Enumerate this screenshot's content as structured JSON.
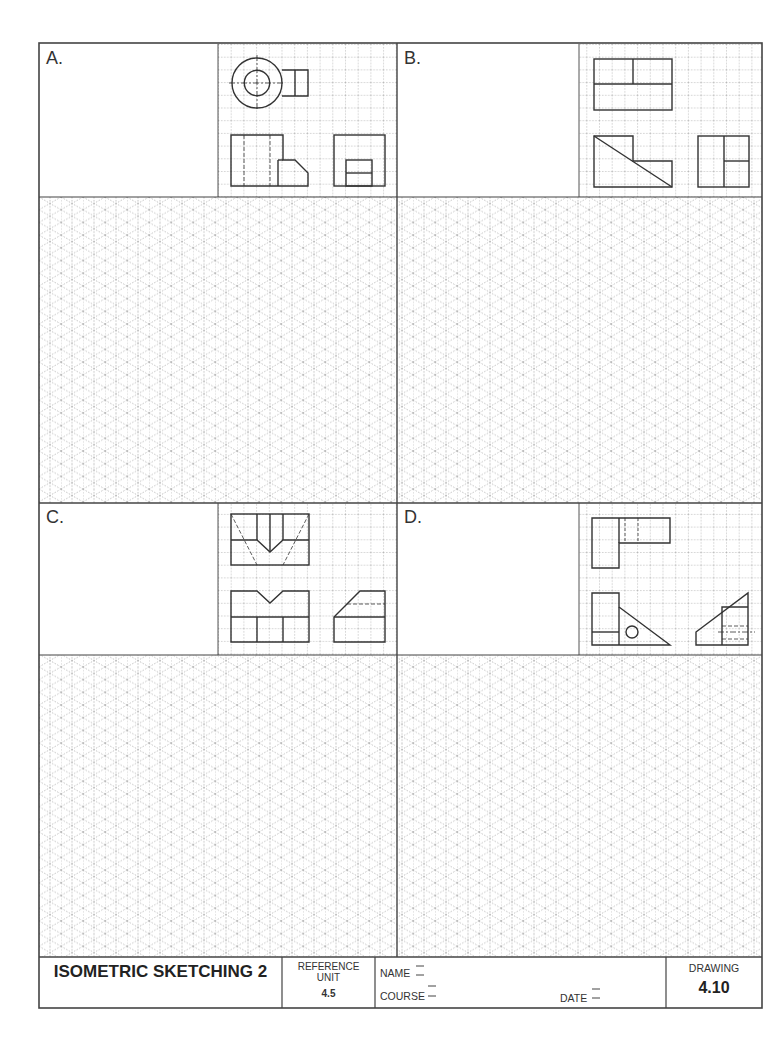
{
  "sheet": {
    "title": "ISOMETRIC SKETCHING 2",
    "reference_label_line1": "REFERENCE",
    "reference_label_line2": "UNIT",
    "reference_value": "4.5",
    "name_label": "NAME",
    "course_label": "COURSE",
    "date_label": "DATE",
    "drawing_label": "DRAWING",
    "drawing_number": "4.10",
    "line_color": "#333333",
    "grid_color": "#8a8a8a"
  },
  "panels": [
    {
      "letter": "A.",
      "id": "a",
      "views": [
        "top-view",
        "front-view",
        "right-side-view"
      ]
    },
    {
      "letter": "B.",
      "id": "b",
      "views": [
        "top-view",
        "front-view",
        "right-side-view"
      ]
    },
    {
      "letter": "C.",
      "id": "c",
      "views": [
        "top-view",
        "front-view",
        "right-side-view"
      ]
    },
    {
      "letter": "D.",
      "id": "d",
      "views": [
        "top-view",
        "front-view",
        "right-side-view"
      ]
    }
  ]
}
